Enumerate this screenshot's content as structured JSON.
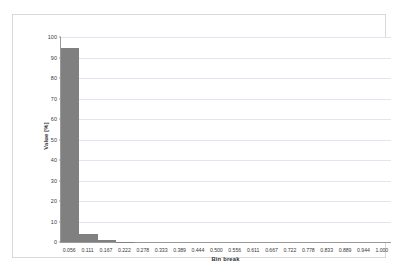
{
  "chart_data": {
    "type": "bar",
    "title": "",
    "subtitle": "",
    "xlabel": "Bin break",
    "ylabel": "Value [%]",
    "categories": [
      "0.056",
      "0.111",
      "0.167",
      "0.222",
      "0.278",
      "0.333",
      "0.389",
      "0.444",
      "0.500",
      "0.556",
      "0.611",
      "0.667",
      "0.722",
      "0.778",
      "0.833",
      "0.889",
      "0.944",
      "1.000"
    ],
    "values": [
      94.5,
      4.0,
      1.0,
      0.15,
      0,
      0,
      0,
      0,
      0,
      0,
      0,
      0,
      0,
      0,
      0,
      0,
      0,
      0
    ],
    "ylim": [
      0,
      100
    ],
    "yticks": [
      0,
      10,
      20,
      30,
      40,
      50,
      60,
      70,
      80,
      90,
      100
    ],
    "ytick_labels": [
      "0",
      "10",
      "20",
      "30",
      "40",
      "50",
      "60",
      "70",
      "80",
      "90",
      "100"
    ],
    "grid": "horizontal",
    "legend": "none",
    "bar_color": "#808080",
    "gridline_color": "#dfe6ef",
    "axis_color": "#9a9a9a",
    "frame_color": "#d9d9d9"
  }
}
